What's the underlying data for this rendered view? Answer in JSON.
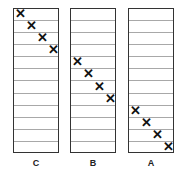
{
  "diagram": {
    "rows_per_column": 12,
    "columns": [
      {
        "label": "C",
        "left": 13,
        "marked_rows": [
          0,
          1,
          2,
          3
        ]
      },
      {
        "label": "B",
        "left": 70,
        "marked_rows": [
          4,
          5,
          6,
          7
        ]
      },
      {
        "label": "A",
        "left": 128,
        "marked_rows": [
          8,
          9,
          10,
          11
        ]
      }
    ],
    "mark_glyph": "✕"
  }
}
